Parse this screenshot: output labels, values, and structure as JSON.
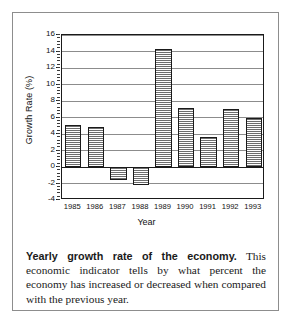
{
  "figure": {
    "caption_lead": "Yearly growth rate of the economy.",
    "caption_body": " This economic indicator tells by what percent the economy has increased or decreased when compared with the previous year."
  },
  "chart_data": {
    "type": "bar",
    "title": "",
    "xlabel": "Year",
    "ylabel": "Growth Rate (%)",
    "categories": [
      "1985",
      "1986",
      "1987",
      "1988",
      "1989",
      "1990",
      "1991",
      "1992",
      "1993"
    ],
    "values": [
      5.1,
      4.8,
      -1.6,
      -2.2,
      14.3,
      7.1,
      3.6,
      7.0,
      6.0
    ],
    "ylim": [
      -4,
      16
    ],
    "ytick_values": [
      16,
      14,
      12,
      10,
      8,
      6,
      4,
      2,
      0,
      -2,
      -4
    ],
    "ytick_labels": [
      "16",
      "14",
      "12",
      "10",
      "8",
      "6",
      "4",
      "2",
      "0",
      "-2",
      "-4"
    ],
    "ytick_step": 2,
    "grid": true,
    "grid_axis": "y",
    "legend": false,
    "bar_fill": "crosshatch-gray",
    "bar_edge_color": "#1a1a1a",
    "axis_color": "#1a1a1a",
    "grid_color": "#8c8c8c",
    "background": "#ffffff"
  }
}
